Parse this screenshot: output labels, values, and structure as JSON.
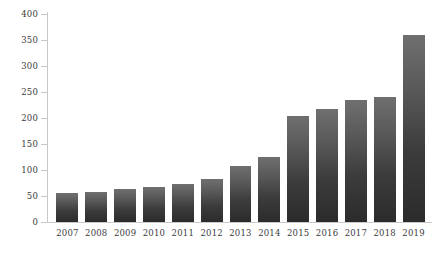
{
  "chart_data": {
    "type": "bar",
    "title": "",
    "subtitle": "",
    "xlabel": "",
    "ylabel": "",
    "categories": [
      "2007",
      "2008",
      "2009",
      "2010",
      "2011",
      "2012",
      "2013",
      "2014",
      "2015",
      "2016",
      "2017",
      "2018",
      "2019"
    ],
    "values": [
      55,
      58,
      63,
      68,
      73,
      83,
      108,
      125,
      203,
      218,
      235,
      240,
      360
    ],
    "ylim": [
      0,
      400
    ],
    "yticks": [
      0,
      50,
      100,
      150,
      200,
      250,
      300,
      350,
      400
    ],
    "ytick_labels": [
      "0",
      "50",
      "100",
      "150",
      "200",
      "250",
      "300",
      "350",
      "400"
    ],
    "grid": false,
    "legend": null,
    "legend_position": "none",
    "series": [
      {
        "name": "",
        "values": [
          55,
          58,
          63,
          68,
          73,
          83,
          108,
          125,
          203,
          218,
          235,
          240,
          360
        ]
      }
    ],
    "colors": {
      "bar_top": "#6f6f6f",
      "bar_bottom": "#2b2b2b",
      "axis": "#c9c9c9",
      "tick_label": "#3b3b3b",
      "background": "#ffffff"
    }
  }
}
